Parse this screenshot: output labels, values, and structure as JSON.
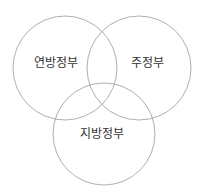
{
  "diagram": {
    "type": "venn",
    "stroke_color": "#9a9a9a",
    "text_color": "#333333",
    "sets": [
      {
        "label": "연방정부",
        "cx": 65,
        "cy": 68,
        "r": 52,
        "label_x": 56,
        "label_y": 67
      },
      {
        "label": "주정부",
        "cx": 139,
        "cy": 68,
        "r": 52,
        "label_x": 147,
        "label_y": 67
      },
      {
        "label": "지방정부",
        "cx": 104,
        "cy": 134,
        "r": 51,
        "label_x": 102,
        "label_y": 138
      }
    ]
  }
}
